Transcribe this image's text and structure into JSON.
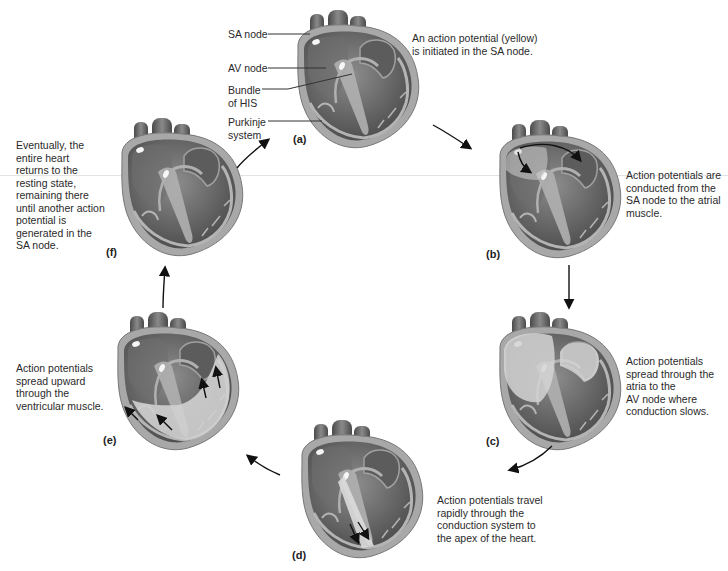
{
  "labels": {
    "sa_node": "SA node",
    "av_node": "AV node",
    "bundle_of_his": "Bundle\nof HIS",
    "purkinje_system": "Purkinje\nsystem"
  },
  "stages": [
    {
      "id": "a",
      "tag": "(a)",
      "caption": "An action potential (yellow)\nis initiated in the SA node."
    },
    {
      "id": "b",
      "tag": "(b)",
      "caption": "Action potentials are\nconducted from the\nSA node to the atrial\nmuscle."
    },
    {
      "id": "c",
      "tag": "(c)",
      "caption": "Action potentials\nspread through the\natria to the\nAV node where\nconduction slows."
    },
    {
      "id": "d",
      "tag": "(d)",
      "caption": "Action potentials travel\nrapidly through the\nconduction system to\nthe apex of the heart."
    },
    {
      "id": "e",
      "tag": "(e)",
      "caption": "Action potentials\nspread upward\nthrough the\nventricular muscle."
    },
    {
      "id": "f",
      "tag": "(f)",
      "caption": "Eventually, the\nentire heart\nreturns to the\nresting state,\nremaining there\nuntil another action\npotential is\ngenerated in the\nSA node."
    }
  ],
  "colors": {
    "muscle_dark": "#5a5a5a",
    "muscle_mid": "#8a8a8a",
    "conduction": "#b8b8b8",
    "excited": "#d2d2d2",
    "node": "#f4f4f4",
    "arrow": "#111111"
  }
}
